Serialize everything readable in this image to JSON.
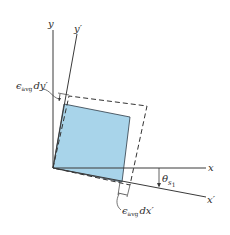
{
  "diagram": {
    "type": "strain-element-rotation",
    "colors": {
      "element_fill": "#a8d4ea",
      "element_stroke": "#2d3a45",
      "axis": "#3a3a3a",
      "dashed": "#333333",
      "background": "#ffffff"
    },
    "axes": {
      "x_label": "x",
      "y_label": "y",
      "x_prime_label": "x′",
      "y_prime_label": "y′"
    },
    "angle_label": {
      "symbol": "θ",
      "subscript": "s",
      "sub_subscript": "1"
    },
    "annotations": {
      "dy": {
        "epsilon": "ϵ",
        "subscript": "avg",
        "suffix": "dy′"
      },
      "dx": {
        "epsilon": "ϵ",
        "subscript": "avg",
        "suffix": "dx′"
      }
    }
  }
}
